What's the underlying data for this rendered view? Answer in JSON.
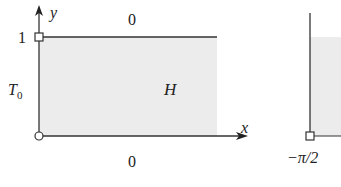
{
  "left_diagram": {
    "region_label": "H",
    "top_boundary_value": "0",
    "bottom_boundary_value": "0",
    "left_boundary_value_base": "T",
    "left_boundary_value_sub": "0",
    "y_tick_label": "1",
    "x_axis_label": "x",
    "y_axis_label": "y"
  },
  "right_diagram": {
    "corner_label": "−π/2"
  },
  "colors": {
    "region_fill": "#ececec",
    "line": "#333333"
  }
}
